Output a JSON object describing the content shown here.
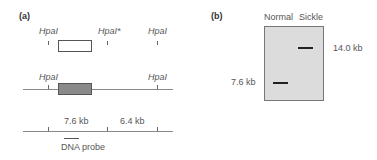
{
  "panel_a": {
    "label": "(a)",
    "row1": {
      "sites": [
        "HpaI",
        "HpaI*",
        "HpaI"
      ]
    },
    "row2": {
      "sites": [
        "HpaI",
        "HpaI"
      ]
    },
    "row3": {
      "fragments": [
        "7.6 kb",
        "6.4 kb"
      ],
      "probe_label": "DNA probe"
    }
  },
  "panel_b": {
    "label": "(b)",
    "lanes": [
      "Normal",
      "Sickle"
    ],
    "bands": [
      {
        "lane": "Normal",
        "size_label": "7.6 kb"
      },
      {
        "lane": "Sickle",
        "size_label": "14.0 kb"
      }
    ]
  }
}
